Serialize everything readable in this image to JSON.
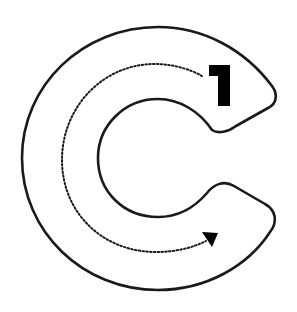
{
  "worksheet": {
    "letter": "C",
    "stroke_number": "1",
    "colors": {
      "outline": "#1a1a1a",
      "dotted_path": "#1a1a1a",
      "arrow": "#000000",
      "number": "#000000",
      "background": "#ffffff"
    }
  }
}
